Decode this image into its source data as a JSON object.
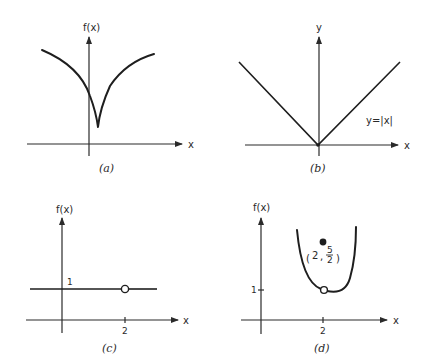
{
  "figure": {
    "panels": [
      {
        "id": "a",
        "caption": "(a)",
        "y_label": "f(x)",
        "x_label": "x",
        "description": "cusp curve with minimum slightly right of y-axis"
      },
      {
        "id": "b",
        "caption": "(b)",
        "y_label": "y",
        "x_label": "x",
        "curve_label": "y=|x|"
      },
      {
        "id": "c",
        "caption": "(c)",
        "y_label": "f(x)",
        "x_label": "x",
        "y_tick": "1",
        "x_tick": "2",
        "open_point": {
          "x": 2,
          "y": 1
        }
      },
      {
        "id": "d",
        "caption": "(d)",
        "y_label": "f(x)",
        "x_label": "x",
        "y_tick": "1",
        "x_tick": "2",
        "open_point": {
          "x": 2,
          "y": 1
        },
        "filled_point": {
          "x": 2,
          "y": 2.5
        },
        "point_label": {
          "open": "(",
          "x": "2",
          "sep": ",",
          "num": "5",
          "den": "2",
          "close": ")"
        }
      }
    ]
  },
  "colors": {
    "ink": "#1e1e1e",
    "background": "#ffffff"
  }
}
